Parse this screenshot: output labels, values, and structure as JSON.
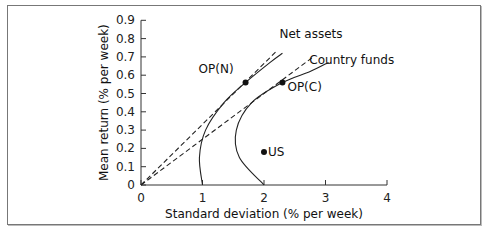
{
  "chart_data": {
    "type": "line",
    "title": "",
    "xlabel": "Standard deviation (% per week)",
    "ylabel": "Mean return (% per week)",
    "xlim": [
      0,
      4
    ],
    "ylim": [
      0,
      0.9
    ],
    "xticks": [
      "0",
      "1",
      "2",
      "3",
      "4"
    ],
    "yticks": [
      "0",
      "0.1",
      "0.2",
      "0.3",
      "0.4",
      "0.5",
      "0.6",
      "0.7",
      "0.8",
      "0.9"
    ],
    "grid": false,
    "series": [
      {
        "name": "Net assets",
        "style": "solid",
        "points": [
          [
            1.0,
            0
          ],
          [
            0.95,
            0.15
          ],
          [
            1.05,
            0.3
          ],
          [
            1.35,
            0.45
          ],
          [
            1.7,
            0.56
          ],
          [
            2.1,
            0.67
          ],
          [
            2.3,
            0.72
          ]
        ]
      },
      {
        "name": "Country funds",
        "style": "solid",
        "points": [
          [
            2.0,
            0
          ],
          [
            1.6,
            0.15
          ],
          [
            1.55,
            0.3
          ],
          [
            1.8,
            0.45
          ],
          [
            2.3,
            0.56
          ],
          [
            2.75,
            0.62
          ],
          [
            3.05,
            0.67
          ]
        ]
      },
      {
        "name": "Tangent to OP(N)",
        "style": "dashed",
        "points": [
          [
            0,
            0
          ],
          [
            2.2,
            0.73
          ]
        ]
      },
      {
        "name": "Tangent to OP(C)",
        "style": "dashed",
        "points": [
          [
            0,
            0
          ],
          [
            2.8,
            0.7
          ]
        ]
      }
    ],
    "annotations": [
      {
        "label": "OP(N)",
        "x": 1.7,
        "y": 0.56
      },
      {
        "label": "OP(C)",
        "x": 2.3,
        "y": 0.56
      },
      {
        "label": "US",
        "x": 2.0,
        "y": 0.18
      },
      {
        "label": "Net assets",
        "x": 2.3,
        "y": 0.73
      },
      {
        "label": "Country funds",
        "x": 2.9,
        "y": 0.63
      }
    ]
  }
}
